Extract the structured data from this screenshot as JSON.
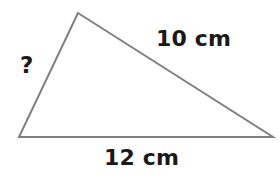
{
  "figure": {
    "kind": "geometry-diagram",
    "shape": "triangle",
    "background_color": "#ffffff",
    "stroke_color": "#808080",
    "stroke_width": 2,
    "text_color": "#1a1a1a",
    "vertices": {
      "apex": {
        "x": 78,
        "y": 13
      },
      "bottom_left": {
        "x": 19,
        "y": 137
      },
      "bottom_right": {
        "x": 273,
        "y": 137
      }
    },
    "labels": {
      "side_upper_right": "10 cm",
      "side_bottom": "12 cm",
      "side_left": "?"
    }
  }
}
